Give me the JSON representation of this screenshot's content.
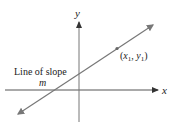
{
  "diagram": {
    "axis_labels": {
      "x": "x",
      "y": "y"
    },
    "line_label": {
      "line1": "Line of slope",
      "line2": "m"
    },
    "point_label": {
      "x_var": "x",
      "x_sub": "1",
      "y_var": "y",
      "y_sub": "1"
    },
    "colors": {
      "axis": "#555555",
      "line": "#777777",
      "point": "#666666",
      "text": "#222222"
    }
  }
}
